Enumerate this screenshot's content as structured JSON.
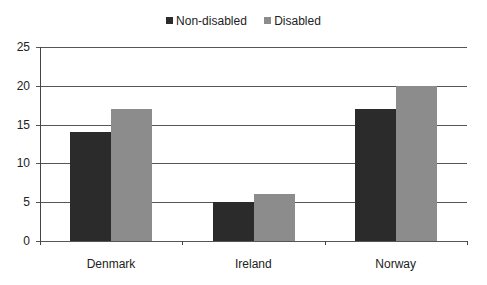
{
  "chart_data": {
    "type": "bar",
    "title": "",
    "xlabel": "",
    "ylabel": "",
    "categories": [
      "Denmark",
      "Ireland",
      "Norway"
    ],
    "series": [
      {
        "name": "Non-disabled",
        "color": "#2b2b2b",
        "values": [
          14,
          5,
          17
        ]
      },
      {
        "name": "Disabled",
        "color": "#8c8c8c",
        "values": [
          17,
          6,
          20
        ]
      }
    ],
    "ylim": [
      0,
      25
    ],
    "yticks": [
      0,
      5,
      10,
      15,
      20,
      25
    ],
    "grid": true,
    "legend_position": "top"
  }
}
